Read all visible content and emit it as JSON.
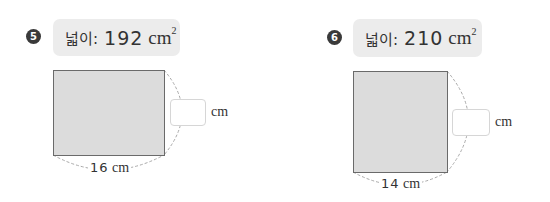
{
  "problems": [
    {
      "number": "5",
      "area_label": "넓이:",
      "area_value": "192",
      "area_unit": "cm",
      "area_exponent": "2",
      "answer_value": "",
      "answer_unit": "cm",
      "known_side_value": "16",
      "known_side_unit": "cm"
    },
    {
      "number": "6",
      "area_label": "넓이:",
      "area_value": "210",
      "area_unit": "cm",
      "area_exponent": "2",
      "answer_value": "",
      "answer_unit": "cm",
      "known_side_value": "14",
      "known_side_unit": "cm"
    }
  ],
  "colors": {
    "badge": "#3a3a3a",
    "label_bg": "#ececec",
    "rect_fill": "#dcdcdc",
    "rect_border": "#6a6a6a",
    "dashed_arc": "#aaaaaa"
  }
}
